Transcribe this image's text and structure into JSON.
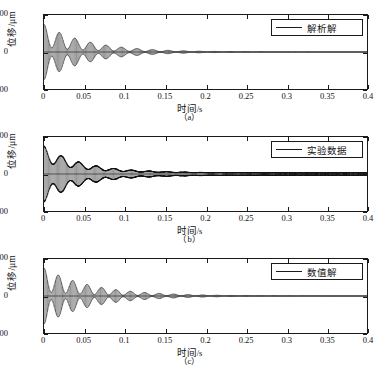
{
  "figure": {
    "panel_count": 3,
    "axis": {
      "xlabel": "时间",
      "xunit": "/s",
      "ylabel": "位移/μm",
      "xticks": [
        "0",
        "0.05",
        "0.1",
        "0.15",
        "0.2",
        "0.25",
        "0.3",
        "0.35",
        "0.4"
      ],
      "yticks": [
        "200",
        "0",
        "−200"
      ],
      "xlim": [
        0,
        0.4
      ],
      "ylim": [
        -200,
        200
      ]
    },
    "panels": [
      {
        "caption": "（a）",
        "legend": "解析解",
        "line_color": "#111111"
      },
      {
        "caption": "（b）",
        "legend": "实验数据",
        "line_color": "#111111"
      },
      {
        "caption": "（c）",
        "legend": "数值解",
        "line_color": "#111111"
      }
    ]
  },
  "chart_data": [
    {
      "type": "line",
      "title": "",
      "subtitle": "（a）",
      "xlabel": "时间/s",
      "ylabel": "位移/μm",
      "xlim": [
        0,
        0.4
      ],
      "ylim": [
        -200,
        200
      ],
      "xticks": [
        0,
        0.05,
        0.1,
        0.15,
        0.2,
        0.25,
        0.3,
        0.35,
        0.4
      ],
      "yticks": [
        -200,
        0,
        200
      ],
      "grid": false,
      "legend": [
        "解析解"
      ],
      "legend_position": "upper right",
      "description": "解析解：带拍频包络的衰减自由振动位移时程",
      "series": [
        {
          "name": "解析解",
          "model": "beating-damped-oscillation",
          "initial_amplitude_um": 150,
          "decay_time_constant_s": 0.055,
          "carrier_frequency_hz": 360,
          "beat_frequency_hz": 52,
          "beat_depth": 0.82,
          "noise_amplitude_um": 0,
          "visible_decay_end_s": 0.25,
          "envelope_points": [
            {
              "t": 0.0,
              "amp": 150
            },
            {
              "t": 0.025,
              "amp": 103
            },
            {
              "t": 0.05,
              "amp": 74
            },
            {
              "t": 0.075,
              "amp": 53
            },
            {
              "t": 0.1,
              "amp": 38
            },
            {
              "t": 0.125,
              "amp": 27
            },
            {
              "t": 0.15,
              "amp": 19
            },
            {
              "t": 0.175,
              "amp": 13
            },
            {
              "t": 0.2,
              "amp": 9
            },
            {
              "t": 0.25,
              "amp": 4
            },
            {
              "t": 0.3,
              "amp": 1
            },
            {
              "t": 0.4,
              "amp": 0
            }
          ]
        }
      ]
    },
    {
      "type": "line",
      "title": "",
      "subtitle": "（b）",
      "xlabel": "时间/s",
      "ylabel": "位移/μm",
      "xlim": [
        0,
        0.4
      ],
      "ylim": [
        -200,
        200
      ],
      "xticks": [
        0,
        0.05,
        0.1,
        0.15,
        0.2,
        0.25,
        0.3,
        0.35,
        0.4
      ],
      "yticks": [
        -200,
        0,
        200
      ],
      "grid": false,
      "legend": [
        "实验数据"
      ],
      "legend_position": "upper right",
      "description": "实验数据：带测量噪声的衰减自由振动位移时程，残余噪声延伸至0.4 s",
      "series": [
        {
          "name": "实验数据",
          "model": "beating-damped-oscillation-with-noise",
          "initial_amplitude_um": 145,
          "decay_time_constant_s": 0.048,
          "carrier_frequency_hz": 360,
          "beat_frequency_hz": 46,
          "beat_depth": 0.6,
          "noise_amplitude_um": 6,
          "visible_decay_end_s": 0.4,
          "envelope_points": [
            {
              "t": 0.0,
              "amp": 145
            },
            {
              "t": 0.025,
              "amp": 94
            },
            {
              "t": 0.05,
              "amp": 62
            },
            {
              "t": 0.075,
              "amp": 42
            },
            {
              "t": 0.1,
              "amp": 29
            },
            {
              "t": 0.125,
              "amp": 21
            },
            {
              "t": 0.15,
              "amp": 16
            },
            {
              "t": 0.175,
              "amp": 13
            },
            {
              "t": 0.2,
              "amp": 11
            },
            {
              "t": 0.25,
              "amp": 9
            },
            {
              "t": 0.3,
              "amp": 7
            },
            {
              "t": 0.4,
              "amp": 6
            }
          ]
        }
      ]
    },
    {
      "type": "line",
      "title": "",
      "subtitle": "（c）",
      "xlabel": "时间/s",
      "ylabel": "位移/μm",
      "xlim": [
        0,
        0.4
      ],
      "ylim": [
        -200,
        200
      ],
      "xticks": [
        0,
        0.05,
        0.1,
        0.15,
        0.2,
        0.25,
        0.3,
        0.35,
        0.4
      ],
      "yticks": [
        -200,
        0,
        200
      ],
      "grid": false,
      "legend": [
        "数值解"
      ],
      "legend_position": "upper right",
      "description": "数值解：带拍频包络的衰减自由振动位移时程，约0.27 s后衰减至零",
      "series": [
        {
          "name": "数值解",
          "model": "beating-damped-oscillation",
          "initial_amplitude_um": 152,
          "decay_time_constant_s": 0.06,
          "carrier_frequency_hz": 350,
          "beat_frequency_hz": 56,
          "beat_depth": 0.85,
          "noise_amplitude_um": 0,
          "visible_decay_end_s": 0.27,
          "envelope_points": [
            {
              "t": 0.0,
              "amp": 152
            },
            {
              "t": 0.025,
              "amp": 108
            },
            {
              "t": 0.05,
              "amp": 80
            },
            {
              "t": 0.075,
              "amp": 59
            },
            {
              "t": 0.1,
              "amp": 44
            },
            {
              "t": 0.125,
              "amp": 32
            },
            {
              "t": 0.15,
              "amp": 23
            },
            {
              "t": 0.175,
              "amp": 16
            },
            {
              "t": 0.2,
              "amp": 11
            },
            {
              "t": 0.25,
              "amp": 5
            },
            {
              "t": 0.3,
              "amp": 2
            },
            {
              "t": 0.4,
              "amp": 0
            }
          ]
        }
      ]
    }
  ]
}
